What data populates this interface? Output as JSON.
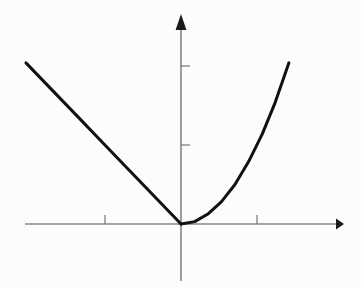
{
  "figure": {
    "width": 361,
    "height": 287,
    "background_color": "#fcfcfc",
    "title": "",
    "caption": ""
  },
  "style": {
    "axis_color": "#4f4f4f",
    "axis_width": 1.1,
    "tick_color": "#6a6a6a",
    "tick_width": 1.1,
    "curve_color": "#111111",
    "curve_width": 3.0,
    "arrow_color": "#1a1a1a"
  },
  "geometry": {
    "origin_px": {
      "x": 181,
      "y": 224
    },
    "unit_px": {
      "x": 76,
      "y": 79
    },
    "x_axis_px": {
      "start": 25,
      "end": 336,
      "arrow_tip": 344
    },
    "y_axis_px": {
      "bottom": 281,
      "top": 30,
      "arrow_tip": 14
    },
    "x_ticks_px": [
      105,
      257
    ],
    "y_ticks_px": [
      145,
      66
    ],
    "tick_len_px": 9,
    "curve_left_end_px": {
      "x": 26,
      "y": 64
    },
    "curve_right_end_px": {
      "x": 289,
      "y": 63
    }
  },
  "chart_data": {
    "type": "line",
    "title": "",
    "subtitle": "",
    "xlabel": "",
    "ylabel": "",
    "grid": false,
    "legend": "none",
    "annotations": [],
    "axes": {
      "x_axis": {
        "arrow": true,
        "range": [
          -2.05,
          2.05
        ],
        "tick_values": [
          -1,
          1
        ],
        "tick_labels": [
          "",
          ""
        ],
        "tick_direction": "up"
      },
      "y_axis": {
        "arrow": true,
        "range": [
          -0.72,
          2.65
        ],
        "tick_values": [
          1,
          2
        ],
        "tick_labels": [
          "",
          ""
        ],
        "tick_direction": "right"
      }
    },
    "series": [
      {
        "name": "left-branch-linear",
        "expression": "y = -x",
        "domain": [
          -2.04,
          0
        ],
        "x": [
          -2.04,
          -1.79,
          -1.53,
          -1.28,
          -1.02,
          -0.77,
          -0.51,
          -0.26,
          0
        ],
        "values": [
          2.04,
          1.79,
          1.53,
          1.28,
          1.02,
          0.77,
          0.51,
          0.26,
          0
        ]
      },
      {
        "name": "right-branch-quadratic",
        "expression": "y = x^2",
        "domain": [
          0,
          1.42
        ],
        "x": [
          0,
          0.18,
          0.36,
          0.53,
          0.71,
          0.89,
          1.07,
          1.24,
          1.42
        ],
        "values": [
          0,
          0.03,
          0.13,
          0.28,
          0.5,
          0.79,
          1.14,
          1.54,
          2.04
        ]
      }
    ],
    "key_points": {
      "vertex": {
        "x": 0,
        "y": 0
      },
      "left_endpoint": {
        "x": -2.04,
        "y": 2.04
      },
      "right_endpoint": {
        "x": 1.42,
        "y": 2.04
      }
    }
  }
}
